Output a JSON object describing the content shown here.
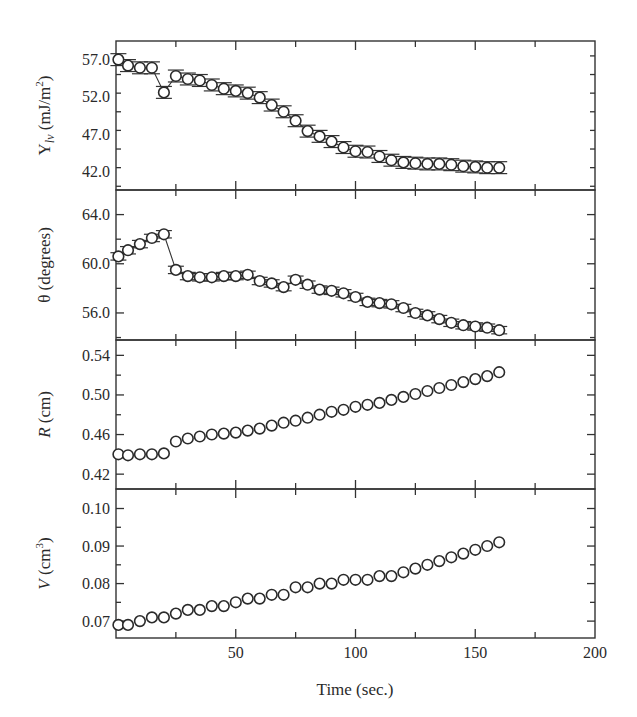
{
  "chart_data": {
    "type": "scatter",
    "layout": "4 vertically stacked panels sharing x-axis",
    "xlabel": "Time (sec.)",
    "xlim": [
      0,
      200
    ],
    "xticks": [
      50,
      100,
      150,
      200
    ],
    "x": [
      1,
      5,
      10,
      15,
      20,
      25,
      30,
      35,
      40,
      45,
      50,
      55,
      60,
      65,
      70,
      75,
      80,
      85,
      90,
      95,
      100,
      105,
      110,
      115,
      120,
      125,
      130,
      135,
      140,
      145,
      150,
      155,
      160
    ],
    "panels": [
      {
        "id": "gamma",
        "ylabel_main": "Y",
        "ylabel_sub": "lv",
        "ylabel_unit": " (mJ/m",
        "ylabel_sup": "2",
        "ylabel_close": ")",
        "ylabel": "γlv (mJ/m²)",
        "ylim": [
          39.5,
          59.5
        ],
        "yticks": [
          42.0,
          47.0,
          52.0,
          57.0
        ],
        "ytick_labels": [
          "42.0",
          "47.0",
          "52.0",
          "57.0"
        ],
        "minor_step": 2.5,
        "connected": true,
        "error_bars": true,
        "error": 0.8,
        "values": [
          57.0,
          56.2,
          55.9,
          55.9,
          52.6,
          54.8,
          54.4,
          54.2,
          53.6,
          53.1,
          52.8,
          52.5,
          51.9,
          50.9,
          50.0,
          48.8,
          47.4,
          46.7,
          46.0,
          45.2,
          44.7,
          44.6,
          44.0,
          43.5,
          43.2,
          43.1,
          43.0,
          43.0,
          42.9,
          42.7,
          42.6,
          42.5,
          42.5
        ]
      },
      {
        "id": "theta",
        "ylabel": "θ (degrees)",
        "ylim": [
          53.8,
          66.0
        ],
        "yticks": [
          56.0,
          60.0,
          64.0
        ],
        "ytick_labels": [
          "56.0",
          "60.0",
          "64.0"
        ],
        "minor_step": 2.0,
        "connected": true,
        "error_bars": true,
        "error": 0.3,
        "values": [
          60.6,
          61.1,
          61.6,
          62.1,
          62.4,
          59.5,
          59.0,
          58.9,
          58.9,
          59.0,
          59.0,
          59.1,
          58.6,
          58.4,
          58.1,
          58.7,
          58.3,
          57.9,
          57.8,
          57.6,
          57.3,
          56.9,
          56.8,
          56.7,
          56.4,
          56.0,
          55.8,
          55.5,
          55.2,
          55.0,
          54.9,
          54.8,
          54.6
        ]
      },
      {
        "id": "radius",
        "ylabel_main": "R",
        "ylabel_unit": " (cm)",
        "ylabel": "R (cm)",
        "ylim": [
          0.405,
          0.5555
        ],
        "yticks": [
          0.42,
          0.46,
          0.5,
          0.54
        ],
        "ytick_labels": [
          "0.42",
          "0.46",
          "0.50",
          "0.54"
        ],
        "minor_step": 0.02,
        "connected": false,
        "error_bars": false,
        "values": [
          0.44,
          0.439,
          0.44,
          0.44,
          0.441,
          0.453,
          0.456,
          0.458,
          0.46,
          0.461,
          0.462,
          0.464,
          0.466,
          0.469,
          0.472,
          0.474,
          0.477,
          0.48,
          0.483,
          0.485,
          0.488,
          0.49,
          0.492,
          0.495,
          0.498,
          0.501,
          0.504,
          0.507,
          0.51,
          0.513,
          0.516,
          0.519,
          0.523
        ]
      },
      {
        "id": "volume",
        "ylabel_main": "V",
        "ylabel_unit": " (cm",
        "ylabel_sup": "3",
        "ylabel_close": ")",
        "ylabel": "V (cm³)",
        "ylim": [
          0.0655,
          0.1052
        ],
        "yticks": [
          0.07,
          0.08,
          0.09,
          0.1
        ],
        "ytick_labels": [
          "0.07",
          "0.08",
          "0.09",
          "0.10"
        ],
        "minor_step": 0.005,
        "connected": false,
        "error_bars": false,
        "values": [
          0.069,
          0.069,
          0.07,
          0.071,
          0.071,
          0.072,
          0.073,
          0.073,
          0.074,
          0.074,
          0.075,
          0.076,
          0.076,
          0.077,
          0.077,
          0.079,
          0.079,
          0.08,
          0.08,
          0.081,
          0.081,
          0.081,
          0.082,
          0.082,
          0.083,
          0.084,
          0.085,
          0.086,
          0.087,
          0.088,
          0.089,
          0.09,
          0.091
        ]
      }
    ],
    "grid": false,
    "legend": null,
    "marker": "open-circle"
  },
  "colors": {
    "axis": "#333333",
    "marker_fill": "#ffffff",
    "marker_stroke": "#2a2a2a",
    "text": "#2a2a2a"
  }
}
